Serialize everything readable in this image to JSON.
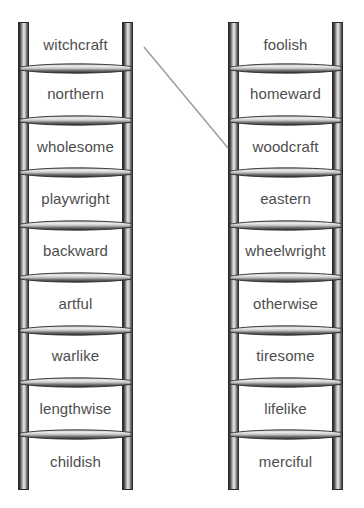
{
  "figure": {
    "type": "word-ladder-diagram",
    "ladder_count": 2,
    "rungs_per_ladder": 8,
    "cells_per_ladder": 9,
    "colors": {
      "background": "#ffffff",
      "text": "#4d4d4d",
      "rail_dark": "#2e2e2e",
      "rail_highlight": "#e8e8e8",
      "rung_dark": "#333333",
      "rung_highlight": "#f2f2f2",
      "connector_line": "#9a9a9a"
    }
  },
  "ladders": [
    {
      "id": "left-ladder",
      "side": "left",
      "words": [
        "witchcraft",
        "northern",
        "wholesome",
        "playwright",
        "backward",
        "artful",
        "warlike",
        "lengthwise",
        "childish"
      ]
    },
    {
      "id": "right-ladder",
      "side": "right",
      "words": [
        "foolish",
        "homeward",
        "woodcraft",
        "eastern",
        "wheelwright",
        "otherwise",
        "tiresome",
        "lifelike",
        "merciful"
      ]
    }
  ],
  "connector": {
    "name": "matching-line",
    "from_ladder": "left-ladder",
    "from_word": "witchcraft",
    "to_ladder": "right-ladder",
    "to_word": "woodcraft",
    "x1": 144,
    "y1": 47,
    "x2": 228,
    "y2": 148
  }
}
